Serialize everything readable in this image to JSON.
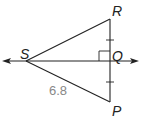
{
  "diagram": {
    "type": "geometry-triangle",
    "points": {
      "R": {
        "label": "R",
        "x": 110,
        "y": 19
      },
      "Q": {
        "label": "Q",
        "x": 110,
        "y": 61
      },
      "P": {
        "label": "P",
        "x": 110,
        "y": 102
      },
      "S": {
        "label": "S",
        "x": 26,
        "y": 61
      }
    },
    "segments": [
      "SR",
      "SP",
      "RP"
    ],
    "line": {
      "through": [
        "S",
        "Q"
      ],
      "arrows": "both"
    },
    "right_angle_at": "Q",
    "congruent_ticks": [
      "RQ",
      "QP"
    ],
    "measurements": {
      "SP": "6.8"
    },
    "colors": {
      "stroke": "#222222",
      "measure_text": "#888888"
    }
  }
}
